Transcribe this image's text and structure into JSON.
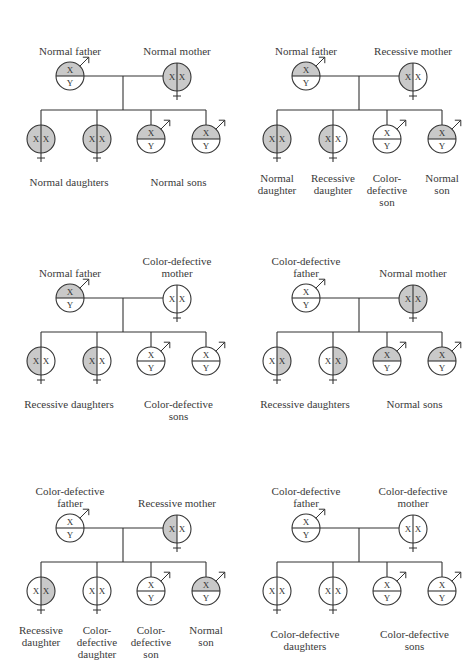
{
  "colors": {
    "filled": "#c9c9c9",
    "empty": "#ffffff",
    "stroke": "#333333"
  },
  "legend_note": "Shaded half = normal X gene; unshaded X = color-defective gene",
  "panels": [
    {
      "father": {
        "label": [
          "Normal father"
        ],
        "x": "filled"
      },
      "mother": {
        "label": [
          "Normal mother"
        ],
        "left": "filled",
        "right": "filled"
      },
      "children": [
        {
          "sex": "female",
          "left": "filled",
          "right": "filled"
        },
        {
          "sex": "female",
          "left": "filled",
          "right": "filled"
        },
        {
          "sex": "male",
          "x": "filled"
        },
        {
          "sex": "male",
          "x": "filled"
        }
      ],
      "child_labels": [
        {
          "text": [
            "Normal daughters"
          ],
          "span": [
            0,
            1
          ]
        },
        {
          "text": [
            "Normal sons"
          ],
          "span": [
            2,
            3
          ]
        }
      ]
    },
    {
      "father": {
        "label": [
          "Normal father"
        ],
        "x": "filled"
      },
      "mother": {
        "label": [
          "Recessive mother"
        ],
        "left": "filled",
        "right": "empty"
      },
      "children": [
        {
          "sex": "female",
          "left": "filled",
          "right": "filled"
        },
        {
          "sex": "female",
          "left": "filled",
          "right": "empty"
        },
        {
          "sex": "male",
          "x": "empty"
        },
        {
          "sex": "male",
          "x": "filled"
        }
      ],
      "child_labels": [
        {
          "text": [
            "Normal",
            "daughter"
          ],
          "span": [
            0,
            0
          ]
        },
        {
          "text": [
            "Recessive",
            "daughter"
          ],
          "span": [
            1,
            1
          ]
        },
        {
          "text": [
            "Color-",
            "defective",
            "son"
          ],
          "span": [
            2,
            2
          ]
        },
        {
          "text": [
            "Normal",
            "son"
          ],
          "span": [
            3,
            3
          ]
        }
      ]
    },
    {
      "father": {
        "label": [
          "Normal father"
        ],
        "x": "filled"
      },
      "mother": {
        "label": [
          "Color-defective",
          "mother"
        ],
        "left": "empty",
        "right": "empty"
      },
      "children": [
        {
          "sex": "female",
          "left": "filled",
          "right": "empty"
        },
        {
          "sex": "female",
          "left": "filled",
          "right": "empty"
        },
        {
          "sex": "male",
          "x": "empty"
        },
        {
          "sex": "male",
          "x": "empty"
        }
      ],
      "child_labels": [
        {
          "text": [
            "Recessive daughters"
          ],
          "span": [
            0,
            1
          ]
        },
        {
          "text": [
            "Color-defective",
            "sons"
          ],
          "span": [
            2,
            3
          ]
        }
      ]
    },
    {
      "father": {
        "label": [
          "Color-defective",
          "father"
        ],
        "x": "empty"
      },
      "mother": {
        "label": [
          "Normal mother"
        ],
        "left": "filled",
        "right": "filled"
      },
      "children": [
        {
          "sex": "female",
          "left": "empty",
          "right": "filled"
        },
        {
          "sex": "female",
          "left": "empty",
          "right": "filled"
        },
        {
          "sex": "male",
          "x": "filled"
        },
        {
          "sex": "male",
          "x": "filled"
        }
      ],
      "child_labels": [
        {
          "text": [
            "Recessive daughters"
          ],
          "span": [
            0,
            1
          ]
        },
        {
          "text": [
            "Normal sons"
          ],
          "span": [
            2,
            3
          ]
        }
      ]
    },
    {
      "father": {
        "label": [
          "Color-defective",
          "father"
        ],
        "x": "empty"
      },
      "mother": {
        "label": [
          "Recessive mother"
        ],
        "left": "filled",
        "right": "empty"
      },
      "children": [
        {
          "sex": "female",
          "left": "empty",
          "right": "filled"
        },
        {
          "sex": "female",
          "left": "empty",
          "right": "empty"
        },
        {
          "sex": "male",
          "x": "empty"
        },
        {
          "sex": "male",
          "x": "filled"
        }
      ],
      "child_labels": [
        {
          "text": [
            "Recessive",
            "daughter"
          ],
          "span": [
            0,
            0
          ]
        },
        {
          "text": [
            "Color-",
            "defective",
            "daughter"
          ],
          "span": [
            1,
            1
          ]
        },
        {
          "text": [
            "Color-",
            "defective",
            "son"
          ],
          "span": [
            2,
            2
          ]
        },
        {
          "text": [
            "Normal",
            "son"
          ],
          "span": [
            3,
            3
          ]
        }
      ]
    },
    {
      "father": {
        "label": [
          "Color-defective",
          "father"
        ],
        "x": "empty"
      },
      "mother": {
        "label": [
          "Color-defective",
          "mother"
        ],
        "left": "empty",
        "right": "empty"
      },
      "children": [
        {
          "sex": "female",
          "left": "empty",
          "right": "empty"
        },
        {
          "sex": "female",
          "left": "empty",
          "right": "empty"
        },
        {
          "sex": "male",
          "x": "empty"
        },
        {
          "sex": "male",
          "x": "empty"
        }
      ],
      "child_labels": [
        {
          "text": [
            "Color-defective",
            "daughters"
          ],
          "span": [
            0,
            1
          ]
        },
        {
          "text": [
            "Color-defective",
            "sons"
          ],
          "span": [
            2,
            3
          ]
        }
      ]
    }
  ],
  "glyphs": {
    "x": "X",
    "y": "Y"
  }
}
